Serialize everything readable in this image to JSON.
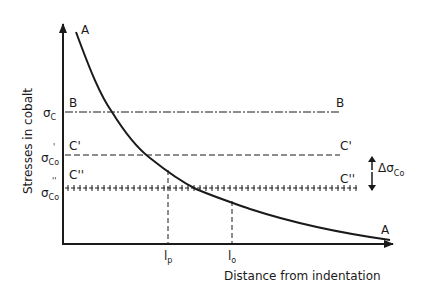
{
  "diagram": {
    "ylabel": "Stresses in cobalt",
    "xlabel": "Distance from indentation",
    "curve": {
      "label_start": "A",
      "label_end": "A"
    },
    "lines": {
      "B": {
        "left_label": "B",
        "right_label": "B",
        "axis_symbol": "σ",
        "axis_sub": "C",
        "style": "dash-dot"
      },
      "C1": {
        "left_label": "C'",
        "right_label": "C'",
        "axis_symbol": "σ",
        "axis_sub": "Co",
        "axis_prime": "'",
        "style": "dashed"
      },
      "C2": {
        "left_label": "C''",
        "right_label": "C''",
        "axis_symbol": "σ",
        "axis_sub": "Co",
        "axis_prime": "''",
        "style": "crosses"
      }
    },
    "delta": {
      "symbol": "Δσ",
      "sub": "Co"
    },
    "x_marks": [
      {
        "main": "l",
        "sub": "p"
      },
      {
        "main": "l",
        "sub": "o"
      }
    ]
  }
}
